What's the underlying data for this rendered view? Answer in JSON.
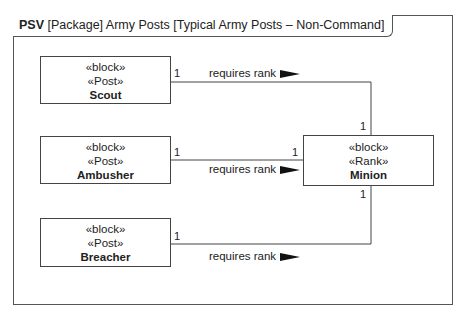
{
  "frame": {
    "kind": "PSV",
    "title": "[Package] Army Posts [Typical Army Posts – Non-Command]"
  },
  "blocks": [
    {
      "id": "scout",
      "stereotypes": [
        "«block»",
        "«Post»"
      ],
      "name": "Scout"
    },
    {
      "id": "ambusher",
      "stereotypes": [
        "«block»",
        "«Post»"
      ],
      "name": "Ambusher"
    },
    {
      "id": "breacher",
      "stereotypes": [
        "«block»",
        "«Post»"
      ],
      "name": "Breacher"
    },
    {
      "id": "minion",
      "stereotypes": [
        "«block»",
        "«Rank»"
      ],
      "name": "Minion"
    }
  ],
  "associations": [
    {
      "from": "Scout",
      "to": "Minion",
      "label": "requires rank",
      "from_mult": "1",
      "to_mult": "1"
    },
    {
      "from": "Ambusher",
      "to": "Minion",
      "label": "requires rank",
      "from_mult": "1",
      "to_mult": "1"
    },
    {
      "from": "Breacher",
      "to": "Minion",
      "label": "requires rank",
      "from_mult": "1",
      "to_mult": "1"
    }
  ]
}
